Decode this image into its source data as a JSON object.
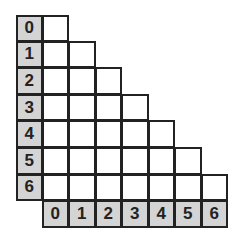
{
  "diagram": {
    "type": "lower-triangular-grid",
    "size": 7,
    "row_headers": [
      "0",
      "1",
      "2",
      "3",
      "4",
      "5",
      "6"
    ],
    "col_headers": [
      "0",
      "1",
      "2",
      "3",
      "4",
      "5",
      "6"
    ],
    "colors": {
      "header_bg": "#d4d4d4",
      "cell_bg": "#ffffff",
      "border": "#222222"
    }
  }
}
